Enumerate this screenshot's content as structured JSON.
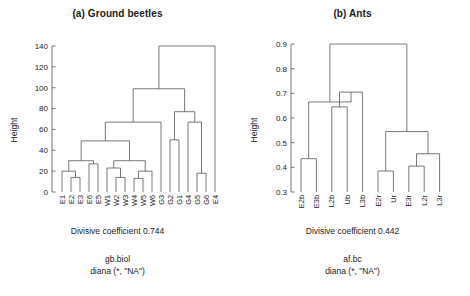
{
  "figure": {
    "panels": [
      {
        "id": "ground-beetles",
        "title": "(a) Ground beetles",
        "axis_title": "Height",
        "coefficient_text": "Divisive coefficient 0.744",
        "subcaption_1": "gb.biol",
        "subcaption_2": "diana (*, \"NA\")"
      },
      {
        "id": "ants",
        "title": "(b) Ants",
        "axis_title": "Height",
        "coefficient_text": "Divisive coefficient 0.442",
        "subcaption_1": "af.bc",
        "subcaption_2": "diana (*, \"NA\")"
      }
    ]
  },
  "chart_data": [
    {
      "type": "dendrogram",
      "title": "(a) Ground beetles",
      "xlabel": "",
      "ylabel": "Height",
      "ylim": [
        0,
        140
      ],
      "yticks": [
        0,
        20,
        40,
        60,
        80,
        100,
        120,
        140
      ],
      "ytick_labels": [
        "0",
        "20",
        "40",
        "60",
        "80",
        "100",
        "120",
        "140"
      ],
      "grid": false,
      "legend": "none",
      "method": "diana",
      "divisive_coefficient": 0.744,
      "dataset": "gb.biol",
      "leaves": [
        "E1",
        "E2",
        "E3",
        "E6",
        "E5",
        "W1",
        "W2",
        "W3",
        "W4",
        "W5",
        "W6",
        "G3",
        "G2",
        "G1",
        "G4",
        "G5",
        "G6",
        "E4"
      ],
      "merges": [
        {
          "name": "E2-E3",
          "height": 14,
          "children": [
            "E2",
            "E3"
          ]
        },
        {
          "name": "E1-(E2E3)",
          "height": 20,
          "children": [
            "E1",
            "E2-E3"
          ]
        },
        {
          "name": "E6-E5",
          "height": 27,
          "children": [
            "E6",
            "E5"
          ]
        },
        {
          "name": "E-cluster",
          "height": 30,
          "children": [
            "E1-(E2E3)",
            "E6-E5"
          ]
        },
        {
          "name": "W2-W3",
          "height": 14,
          "children": [
            "W2",
            "W3"
          ]
        },
        {
          "name": "W1-(W2W3)",
          "height": 23,
          "children": [
            "W1",
            "W2-W3"
          ]
        },
        {
          "name": "W4-W5",
          "height": 13,
          "children": [
            "W4",
            "W5"
          ]
        },
        {
          "name": "(W4W5)-W6",
          "height": 20,
          "children": [
            "W4-W5",
            "W6"
          ]
        },
        {
          "name": "W-cluster",
          "height": 30,
          "children": [
            "W1-(W2W3)",
            "(W4W5)-W6"
          ]
        },
        {
          "name": "EW-cluster",
          "height": 49,
          "children": [
            "E-cluster",
            "W-cluster"
          ]
        },
        {
          "name": "EW-G3",
          "height": 67,
          "children": [
            "EW-cluster",
            "G3"
          ]
        },
        {
          "name": "G2-G1",
          "height": 50,
          "children": [
            "G2",
            "G1"
          ]
        },
        {
          "name": "G5-G6",
          "height": 18,
          "children": [
            "G5",
            "G6"
          ]
        },
        {
          "name": "G4-(G5G6)",
          "height": 67,
          "children": [
            "G4",
            "G5-G6"
          ]
        },
        {
          "name": "G-cluster",
          "height": 77,
          "children": [
            "G2-G1",
            "G4-(G5G6)"
          ]
        },
        {
          "name": "main-cluster",
          "height": 99,
          "children": [
            "EW-G3",
            "G-cluster"
          ]
        },
        {
          "name": "root",
          "height": 140,
          "children": [
            "main-cluster",
            "E4"
          ]
        }
      ]
    },
    {
      "type": "dendrogram",
      "title": "(b) Ants",
      "xlabel": "",
      "ylabel": "Height",
      "ylim": [
        0.3,
        0.9
      ],
      "yticks": [
        0.3,
        0.4,
        0.5,
        0.6,
        0.7,
        0.8,
        0.9
      ],
      "ytick_labels": [
        "0.3",
        "0.4",
        "0.5",
        "0.6",
        "0.7",
        "0.8",
        "0.9"
      ],
      "grid": false,
      "legend": "none",
      "method": "diana",
      "divisive_coefficient": 0.442,
      "dataset": "af.bc",
      "leaves": [
        "E2b",
        "E3b",
        "L2b",
        "Ub",
        "L3b",
        "E2r",
        "Ur",
        "E3r",
        "L2r",
        "L3r"
      ],
      "merges": [
        {
          "name": "E2b-E3b",
          "height": 0.435,
          "children": [
            "E2b",
            "E3b"
          ]
        },
        {
          "name": "L2b-Ub",
          "height": 0.645,
          "children": [
            "L2b",
            "Ub"
          ]
        },
        {
          "name": "(L2bUb)-L3b",
          "height": 0.705,
          "children": [
            "L2b-Ub",
            "L3b"
          ]
        },
        {
          "name": "b-cluster",
          "height": 0.665,
          "children": [
            "E2b-E3b",
            "(L2bUb)-L3b"
          ]
        },
        {
          "name": "E2r-Ur",
          "height": 0.385,
          "children": [
            "E2r",
            "Ur"
          ]
        },
        {
          "name": "E3r-L2r",
          "height": 0.405,
          "children": [
            "E3r",
            "L2r"
          ]
        },
        {
          "name": "(E3rL2r)-L3r",
          "height": 0.455,
          "children": [
            "E3r-L2r",
            "L3r"
          ]
        },
        {
          "name": "r-cluster",
          "height": 0.545,
          "children": [
            "E2r-Ur",
            "(E3rL2r)-L3r"
          ]
        },
        {
          "name": "root",
          "height": 0.9,
          "children": [
            "b-cluster",
            "r-cluster"
          ]
        }
      ]
    }
  ]
}
